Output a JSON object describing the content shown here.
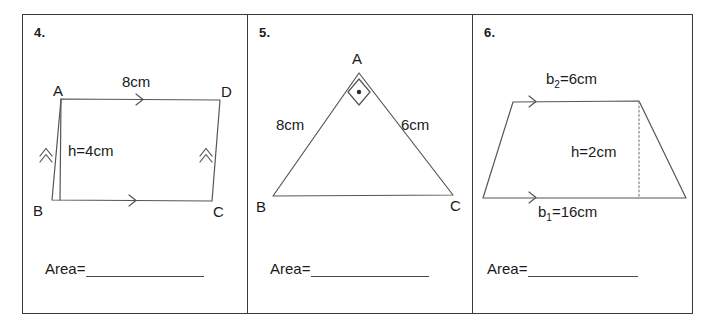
{
  "worksheet": {
    "title": "Area Practice Problems",
    "background_color": "#ffffff",
    "line_color": "#555555",
    "border_color": "#3a3a3a",
    "text_color": "#1a1a1a"
  },
  "problems": [
    {
      "number": "4.",
      "shape": "parallelogram",
      "vertices": [
        "A",
        "B",
        "C",
        "D"
      ],
      "vertex_labels": {
        "a": "A",
        "b": "B",
        "c": "C",
        "d": "D"
      },
      "measurements": {
        "base": "8cm",
        "height": "h=4cm"
      },
      "answer_label": "Area=",
      "answer_value": ""
    },
    {
      "number": "5.",
      "shape": "triangle",
      "vertices": [
        "A",
        "B",
        "C"
      ],
      "vertex_labels": {
        "a": "A",
        "b": "B",
        "c": "C"
      },
      "measurements": {
        "left_side": "8cm",
        "right_side": "6cm"
      },
      "right_angle_at": "A",
      "answer_label": "Area=",
      "answer_value": ""
    },
    {
      "number": "6.",
      "shape": "trapezoid",
      "measurements": {
        "top_base": "b₂=6cm",
        "top_base_symbol": "b",
        "top_base_subscript": "2",
        "top_base_value": "=6cm",
        "height": "h=2cm",
        "bottom_base": "b₁=16cm",
        "bottom_base_symbol": "b",
        "bottom_base_subscript": "1",
        "bottom_base_value": "=16cm"
      },
      "answer_label": "Area=",
      "answer_value": ""
    }
  ]
}
